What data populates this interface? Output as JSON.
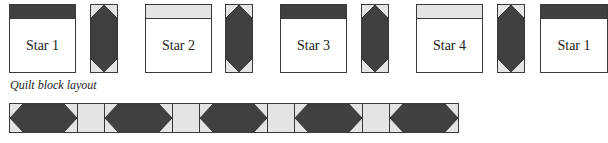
{
  "colors": {
    "dark": "#404040",
    "light": "#e4e4e4",
    "outline": "#3a3a3a",
    "white": "#ffffff"
  },
  "top_row": {
    "blocks": [
      {
        "label": "Star 1",
        "band": "dark"
      },
      {
        "label": "Star 2",
        "band": "light"
      },
      {
        "label": "Star 3",
        "band": "dark"
      },
      {
        "label": "Star 4",
        "band": "light"
      },
      {
        "label": "Star 1",
        "band": "dark"
      }
    ],
    "sashing_count": 4
  },
  "caption": "Quilt block layout",
  "bottom_strip": {
    "segments": [
      "hexagon",
      "light",
      "hexagon",
      "light",
      "hexagon",
      "light",
      "hexagon",
      "light",
      "hexagon"
    ]
  }
}
